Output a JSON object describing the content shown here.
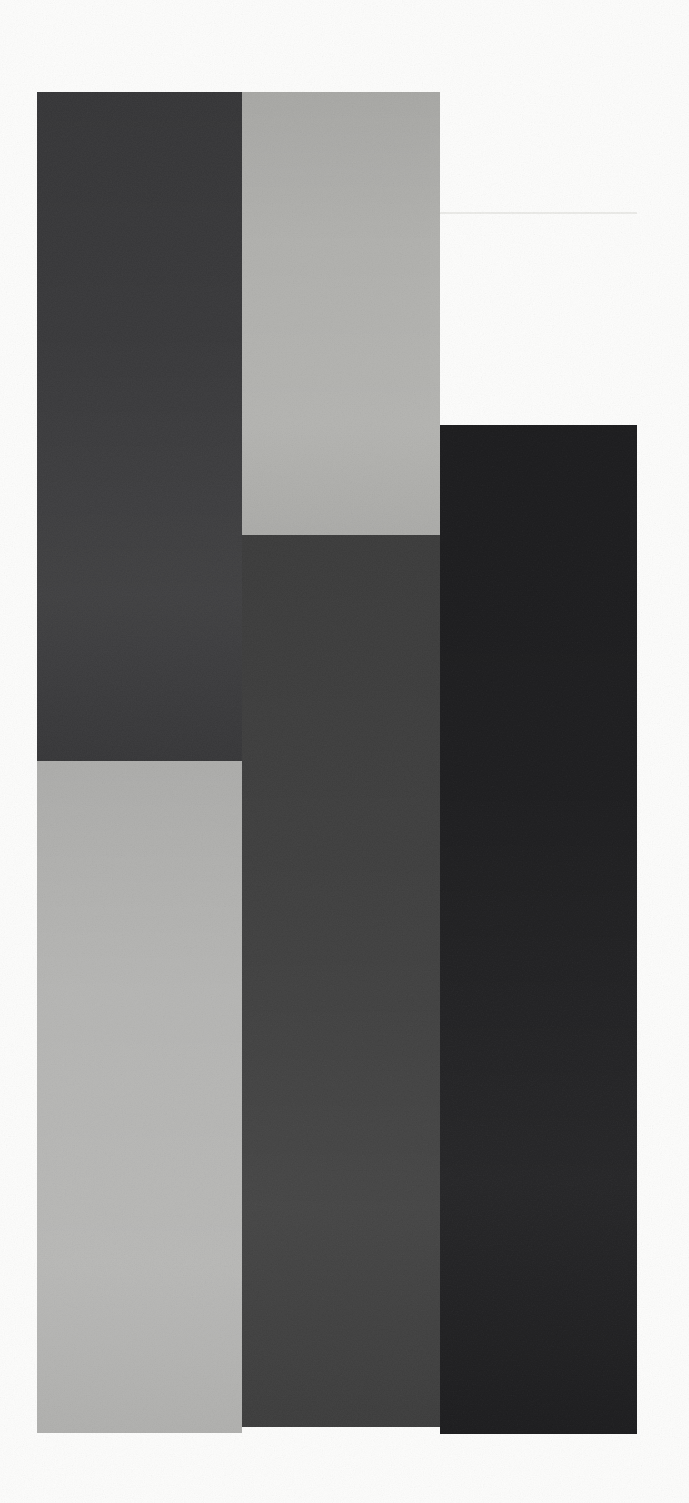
{
  "artwork": {
    "description": "abstract-minimalist-composition-of-five-rectangles",
    "canvas": {
      "width": 689,
      "height": 1503,
      "background": "#fdfdfc"
    },
    "palette": {
      "charcoal": "#38383a",
      "light_gray_top": "#b1b1ae",
      "light_gray_bottom": "#b6b6b4",
      "dark_gray": "#3e3e3e",
      "near_black": "#1c1c1e",
      "seam": "#ebebe8",
      "white_ground": "#fdfdfc"
    },
    "blocks": [
      {
        "id": "charcoal-left-top",
        "x": 37,
        "y": 92,
        "w": 205,
        "h": 669,
        "color": "#38383a"
      },
      {
        "id": "lightgray-middle-top",
        "x": 242,
        "y": 92,
        "w": 198,
        "h": 443,
        "color": "#b1b1ae"
      },
      {
        "id": "black-right",
        "x": 440,
        "y": 425,
        "w": 197,
        "h": 1009,
        "color": "#1c1c1e"
      },
      {
        "id": "darkgray-middle-bottom",
        "x": 242,
        "y": 535,
        "w": 198,
        "h": 892,
        "color": "#3e3e3e"
      },
      {
        "id": "lightgray-left-bottom",
        "x": 37,
        "y": 761,
        "w": 205,
        "h": 672,
        "color": "#b6b6b4"
      }
    ],
    "seam_line": {
      "x": 440,
      "y": 212,
      "w": 197,
      "color": "#ebebe8"
    }
  }
}
